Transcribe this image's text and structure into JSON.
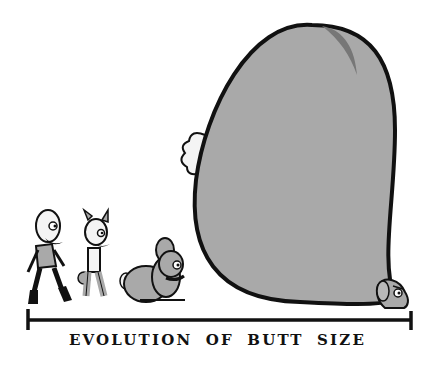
{
  "caption": "EVOLUTION OF BUTT SIZE",
  "figures": [
    {
      "id": "human",
      "label": "walking bald human with goatee"
    },
    {
      "id": "hybrid",
      "label": "bunny-eared human hybrid with small tail"
    },
    {
      "id": "bunny",
      "label": "small grey bunny"
    },
    {
      "id": "giant-butt-bunny",
      "label": "bunny with enormous butt"
    }
  ],
  "colors": {
    "outline": "#111111",
    "fill_grey": "#a9a9a9",
    "fill_light": "#f4f4f4",
    "background": "#ffffff"
  }
}
